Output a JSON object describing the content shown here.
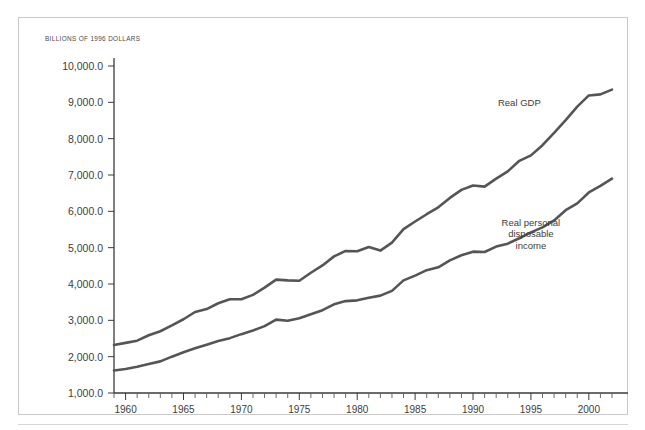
{
  "figure": {
    "axis_note": "BILLIONS OF 1996 DOLLARS"
  },
  "chart_data": {
    "type": "line",
    "title": "",
    "subtitle": "",
    "xlabel": "",
    "ylabel": "BILLIONS OF 1996 DOLLARS",
    "ylim": [
      1000,
      10000
    ],
    "xlim": [
      1959,
      2002
    ],
    "grid": false,
    "legend_position": "inline-annotations",
    "ytick_values": [
      1000,
      2000,
      3000,
      4000,
      5000,
      6000,
      7000,
      8000,
      9000,
      10000
    ],
    "ytick_labels": [
      "1,000.0",
      "2,000.0",
      "3,000.0",
      "4,000.0",
      "5,000.0",
      "6,000.0",
      "7,000.0",
      "8,000.0",
      "9,000.0",
      "10,000.0"
    ],
    "xtick_values": [
      1960,
      1965,
      1970,
      1975,
      1980,
      1985,
      1990,
      1995,
      2000
    ],
    "xtick_labels": [
      "1960",
      "1965",
      "1970",
      "1975",
      "1980",
      "1985",
      "1990",
      "1995",
      "2000"
    ],
    "xtick_minor_step": 1,
    "x": [
      1959,
      1960,
      1961,
      1962,
      1963,
      1964,
      1965,
      1966,
      1967,
      1968,
      1969,
      1970,
      1971,
      1972,
      1973,
      1974,
      1975,
      1976,
      1977,
      1978,
      1979,
      1980,
      1981,
      1982,
      1983,
      1984,
      1985,
      1986,
      1987,
      1988,
      1989,
      1990,
      1991,
      1992,
      1993,
      1994,
      1995,
      1996,
      1997,
      1998,
      1999,
      2000,
      2001,
      2002
    ],
    "series": [
      {
        "name": "Real GDP",
        "label": "Real GDP",
        "label_lines": [
          "Real GDP"
        ],
        "color": "#555555",
        "values": [
          2320,
          2380,
          2440,
          2590,
          2700,
          2860,
          3030,
          3230,
          3310,
          3470,
          3580,
          3580,
          3700,
          3900,
          4120,
          4100,
          4090,
          4310,
          4510,
          4760,
          4910,
          4900,
          5020,
          4920,
          5140,
          5510,
          5720,
          5920,
          6110,
          6370,
          6590,
          6710,
          6680,
          6900,
          7100,
          7390,
          7540,
          7820,
          8160,
          8510,
          8880,
          9190,
          9220,
          9350
        ]
      },
      {
        "name": "Real personal disposable income",
        "label": "Real personal disposable income",
        "label_lines": [
          "Real personal",
          "disposable",
          "income"
        ],
        "color": "#555555",
        "values": [
          1620,
          1660,
          1720,
          1800,
          1870,
          2000,
          2120,
          2230,
          2330,
          2430,
          2510,
          2620,
          2720,
          2840,
          3020,
          2990,
          3060,
          3170,
          3280,
          3440,
          3530,
          3550,
          3620,
          3680,
          3810,
          4100,
          4230,
          4380,
          4460,
          4650,
          4790,
          4890,
          4880,
          5030,
          5110,
          5260,
          5420,
          5560,
          5750,
          6030,
          6220,
          6520,
          6700,
          6900
        ]
      }
    ],
    "annotations": [
      {
        "text": "Real GDP",
        "series": "Real GDP",
        "x": 1994,
        "y": 8900
      },
      {
        "text": "Real personal disposable income",
        "series": "Real personal disposable income",
        "x": 1995,
        "y": 5600
      }
    ]
  }
}
